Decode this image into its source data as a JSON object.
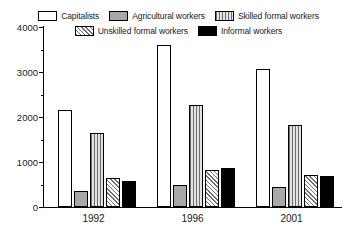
{
  "chart_data": {
    "type": "bar",
    "title": "",
    "xlabel": "",
    "ylabel": "",
    "categories": [
      "1992",
      "1996",
      "2001"
    ],
    "series": [
      {
        "name": "Capitalists",
        "values": [
          2150,
          3600,
          3060
        ],
        "pattern": "open-white",
        "color": "#ffffff"
      },
      {
        "name": "Agricultural workers",
        "values": [
          360,
          490,
          450
        ],
        "pattern": "solid-grey",
        "color": "#a8a8a8"
      },
      {
        "name": "Skilled formal workers",
        "values": [
          1650,
          2270,
          1820
        ],
        "pattern": "vertical-lines",
        "color": "#c8c8c8"
      },
      {
        "name": "Unskilled formal workers",
        "values": [
          650,
          820,
          710
        ],
        "pattern": "diagonal-hatch",
        "color": "#d0d0d0"
      },
      {
        "name": "Informal workers",
        "values": [
          570,
          860,
          680
        ],
        "pattern": "solid-black",
        "color": "#000000"
      }
    ],
    "ylim": [
      0,
      4000
    ],
    "ytick_labels": [
      "0",
      "1000",
      "2000",
      "3000",
      "4000"
    ],
    "ytick_values": [
      0,
      1000,
      2000,
      3000,
      4000
    ],
    "yminor_values": [
      500,
      1500,
      2500,
      3500
    ],
    "grid": false,
    "legend_position": "top"
  },
  "legend": {
    "rows": [
      [
        "Capitalists",
        "Agricultural workers",
        "Skilled formal workers"
      ],
      [
        "Unskilled formal workers",
        "Informal workers"
      ]
    ]
  }
}
